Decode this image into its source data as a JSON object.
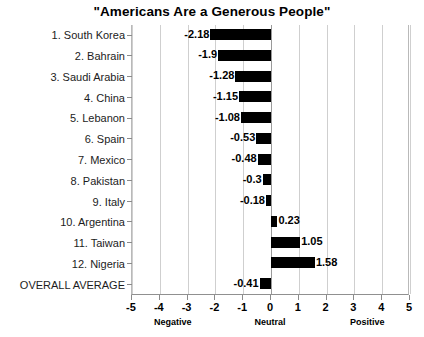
{
  "chart_data": {
    "type": "bar",
    "orientation": "horizontal",
    "title": "\"Americans Are a Generous People\"",
    "xlabel": "",
    "ylabel": "",
    "xlim": [
      -5,
      5
    ],
    "grid": true,
    "legend": "none",
    "xticks": [
      -5,
      -4,
      -3,
      -2,
      -1,
      0,
      1,
      2,
      3,
      4,
      5
    ],
    "xtick_labels": [
      "-5",
      "-4",
      "-3",
      "-2",
      "-1",
      "0",
      "1",
      "2",
      "3",
      "4",
      "5"
    ],
    "zone_labels": [
      {
        "text": "Negative",
        "at": -3.5
      },
      {
        "text": "Neutral",
        "at": 0
      },
      {
        "text": "Positive",
        "at": 3.5
      }
    ],
    "categories": [
      "1. South Korea",
      "2. Bahrain",
      "3. Saudi Arabia",
      "4. China",
      "5. Lebanon",
      "6. Spain",
      "7. Mexico",
      "8. Pakistan",
      "9. Italy",
      "10. Argentina",
      "11. Taiwan",
      "12. Nigeria",
      "OVERALL AVERAGE"
    ],
    "values": [
      -2.18,
      -1.9,
      -1.28,
      -1.15,
      -1.08,
      -0.53,
      -0.48,
      -0.3,
      -0.18,
      0.23,
      1.05,
      1.58,
      -0.41
    ],
    "value_labels": [
      "-2.18",
      "-1.9",
      "-1.28",
      "-1.15",
      "-1.08",
      "-0.53",
      "-0.48",
      "-0.3",
      "-0.18",
      "0.23",
      "1.05",
      "1.58",
      "-0.41"
    ],
    "bar_color": "#000000",
    "grid_color": "#cfcfcf",
    "axis_color": "#909090",
    "background": "#ffffff"
  }
}
